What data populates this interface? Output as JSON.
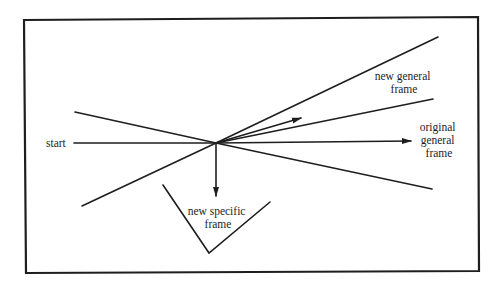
{
  "diagram": {
    "labels": {
      "start": "start",
      "new_general_frame": [
        "new general",
        "frame"
      ],
      "original_general_frame": [
        "original",
        "general",
        "frame"
      ],
      "new_specific_frame": [
        "new specific",
        "frame"
      ]
    },
    "colors": {
      "line": "#1e1e1e",
      "background": "#ffffff"
    },
    "geometry": {
      "border": {
        "x1": 24,
        "y1": 19,
        "x2": 478,
        "y2": 272
      },
      "origin": {
        "x": 216,
        "y": 143
      }
    }
  }
}
